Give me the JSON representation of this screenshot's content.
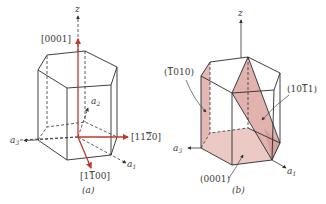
{
  "figure": {
    "panel_a": {
      "caption": "(a)",
      "axis_labels": {
        "z": "z",
        "a1": "a",
        "a1_sub": "1",
        "a2": "a",
        "a2_sub": "2",
        "a3": "a",
        "a3_sub": "3"
      },
      "directions": [
        {
          "label": "[0001]",
          "description": "vertical direction along z"
        },
        {
          "label": "[1120]",
          "overbar_on": "2",
          "display": "[11̅2̅0]",
          "description": "horizontal direction to the right"
        },
        {
          "label": "[1100]",
          "overbar_on": "1 (second)",
          "display": "[11̅ 00]",
          "description": "direction toward front-lower-right"
        }
      ],
      "colors": {
        "direction_arrows": "#c0392b",
        "edges": "#2a2a2a"
      }
    },
    "panel_b": {
      "caption": "(b)",
      "axis_labels": {
        "z": "z",
        "a1": "a",
        "a1_sub": "1",
        "a3": "a",
        "a3_sub": "3"
      },
      "planes": [
        {
          "label": "(1010)",
          "overbar_on": "first 1",
          "description": "prismatic side face"
        },
        {
          "label": "(1011)",
          "overbar_on": "last 1",
          "description": "pyramidal plane"
        },
        {
          "label": "(0001)",
          "description": "basal plane"
        }
      ],
      "colors": {
        "plane_fill": "#e8c1bd",
        "plane_fill_dark": "#d9a5a0",
        "edges": "#2a2a2a"
      }
    },
    "text": {
      "a_z": "z",
      "a_0001": "[0001]",
      "a_1120_pre": "[11",
      "a_1120_bar": "2",
      "a_1120_post": "0]",
      "a_1100_pre": "[1",
      "a_1100_bar": "1",
      "a_1100_post": "00]",
      "a_caption": "(a)",
      "b_z": "z",
      "b_1010_pre": "(",
      "b_1010_bar": "1",
      "b_1010_post": "010)",
      "b_1011_pre": "(10",
      "b_1011_bar": "1",
      "b_1011_post": "1)",
      "b_0001": "(0001)",
      "b_caption": "(b)",
      "a_letter": "a",
      "sub1": "1",
      "sub2": "2",
      "sub3": "3"
    }
  }
}
